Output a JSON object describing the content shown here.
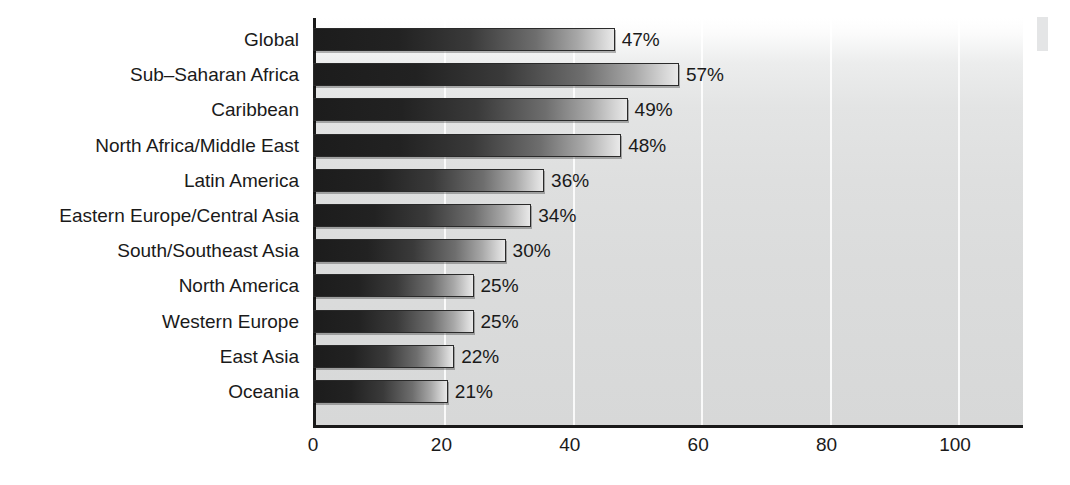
{
  "chart_data": {
    "type": "bar",
    "orientation": "horizontal",
    "title": "",
    "subtitle": "",
    "xlabel": "",
    "ylabel": "",
    "categories": [
      "Global",
      "Sub–Saharan Africa",
      "Caribbean",
      "North Africa/Middle East",
      "Latin America",
      "Eastern Europe/Central Asia",
      "South/Southeast Asia",
      "North America",
      "Western Europe",
      "East Asia",
      "Oceania"
    ],
    "values": [
      47,
      57,
      49,
      48,
      36,
      34,
      30,
      25,
      25,
      22,
      21
    ],
    "value_labels": [
      "47%",
      "57%",
      "49%",
      "48%",
      "36%",
      "34%",
      "30%",
      "25%",
      "25%",
      "22%",
      "21%"
    ],
    "xlim": [
      0,
      110
    ],
    "xticks": [
      0,
      20,
      40,
      60,
      80,
      100
    ],
    "xtick_labels": [
      "0",
      "20",
      "40",
      "60",
      "80",
      "100"
    ],
    "grid": "vertical-white",
    "legend": "none",
    "bar_fill": "#1c1c1c",
    "bar_fill_end": "#e9e9e9",
    "plot_bg": "#dedfdf",
    "text_color": "#1a1a1a",
    "axis_color": "#1a1a1a"
  }
}
